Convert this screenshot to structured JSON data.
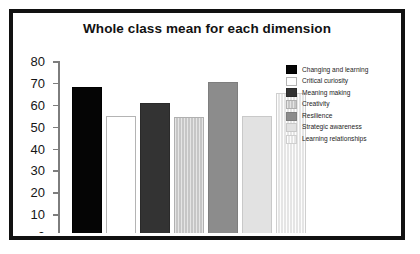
{
  "page_bleed_text": "",
  "figure": {
    "title": "Whole class mean for each dimension"
  },
  "chart_data": {
    "type": "bar",
    "title": "Whole class mean for each dimension",
    "xlabel": "",
    "ylabel": "",
    "ylim": [
      0,
      80
    ],
    "yticks": [
      0,
      10,
      20,
      30,
      40,
      50,
      60,
      70,
      80
    ],
    "ytick_labels": [
      "0",
      "10",
      "20",
      "30",
      "40",
      "50",
      "60",
      "70",
      "80"
    ],
    "grid": false,
    "legend_position": "right",
    "categories": [
      "Changing and learning",
      "Critical curiosity",
      "Meaning making",
      "Creativity",
      "Resilience",
      "Strategic awareness",
      "Learning relationships"
    ],
    "values": [
      68,
      55,
      61,
      54.5,
      70.5,
      55,
      65.5
    ],
    "colors": [
      "#050505",
      "#ffffff",
      "#333333",
      "#c6c6c6",
      "#8c8c8c",
      "#e2e2e2",
      "#ededed"
    ],
    "series": [
      {
        "name": "Whole class mean",
        "values": [
          68,
          55,
          61,
          54.5,
          70.5,
          55,
          65.5
        ]
      }
    ]
  },
  "legend": {
    "items": [
      {
        "label": "Changing and learning",
        "color": "#050505",
        "fill_class": "fill-black"
      },
      {
        "label": "Critical curiosity",
        "color": "#ffffff",
        "fill_class": "fill-white"
      },
      {
        "label": "Meaning making",
        "color": "#333333",
        "fill_class": "fill-dark"
      },
      {
        "label": "Creativity",
        "color": "#c6c6c6",
        "fill_class": "fill-lightgrey"
      },
      {
        "label": "Resilience",
        "color": "#8c8c8c",
        "fill_class": "fill-midgrey"
      },
      {
        "label": "Strategic awareness",
        "color": "#e2e2e2",
        "fill_class": "fill-palegrey"
      },
      {
        "label": "Learning relationships",
        "color": "#ededed",
        "fill_class": "fill-palest"
      }
    ]
  }
}
